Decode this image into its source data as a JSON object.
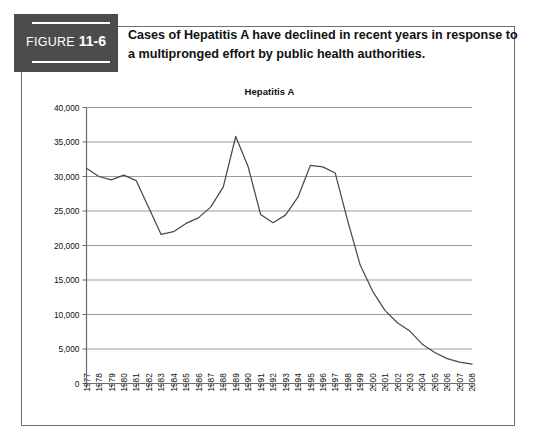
{
  "figure": {
    "badge_word": "FIGURE",
    "badge_number": "11-6",
    "caption_line1": "Cases of Hepatitis A have declined in recent years in response to",
    "caption_line2": "a multipronged effort by public health authorities."
  },
  "colors": {
    "badge_background": "#4c4c4c",
    "badge_text": "#ffffff",
    "frame_border": "#6f6f6f",
    "gridline": "#9b9b9b",
    "axis": "#6b6b6b",
    "data_line": "#4a4a4a",
    "text": "#111111",
    "page_background": "#ffffff"
  },
  "chart_data": {
    "type": "line",
    "title": "Hepatitis A",
    "xlabel": "",
    "ylabel": "",
    "ylim": [
      0,
      40000
    ],
    "ytick_values": [
      0,
      5000,
      10000,
      15000,
      20000,
      25000,
      30000,
      35000,
      40000
    ],
    "ytick_labels": [
      "0",
      "5,000",
      "10,000",
      "15,000",
      "20,000",
      "25,000",
      "30,000",
      "35,000",
      "40,000"
    ],
    "grid": "horizontal",
    "legend": "none",
    "categories": [
      "1977",
      "1978",
      "1979",
      "1980",
      "1981",
      "1982",
      "1983",
      "1984",
      "1985",
      "1986",
      "1987",
      "1988",
      "1989",
      "1990",
      "1991",
      "1992",
      "1993",
      "1994",
      "1995",
      "1996",
      "1997",
      "1998",
      "1999",
      "2000",
      "2001",
      "2002",
      "2003",
      "2004",
      "2005",
      "2006",
      "2007",
      "2008"
    ],
    "series": [
      {
        "name": "Hepatitis A",
        "values": [
          31200,
          30000,
          29500,
          30200,
          29400,
          25500,
          21600,
          22000,
          23200,
          24000,
          25600,
          28500,
          35800,
          31400,
          24500,
          23300,
          24400,
          27000,
          31600,
          31400,
          30500,
          23600,
          17200,
          13400,
          10600,
          8800,
          7600,
          5700,
          4500,
          3600,
          3100,
          2800
        ]
      }
    ]
  }
}
